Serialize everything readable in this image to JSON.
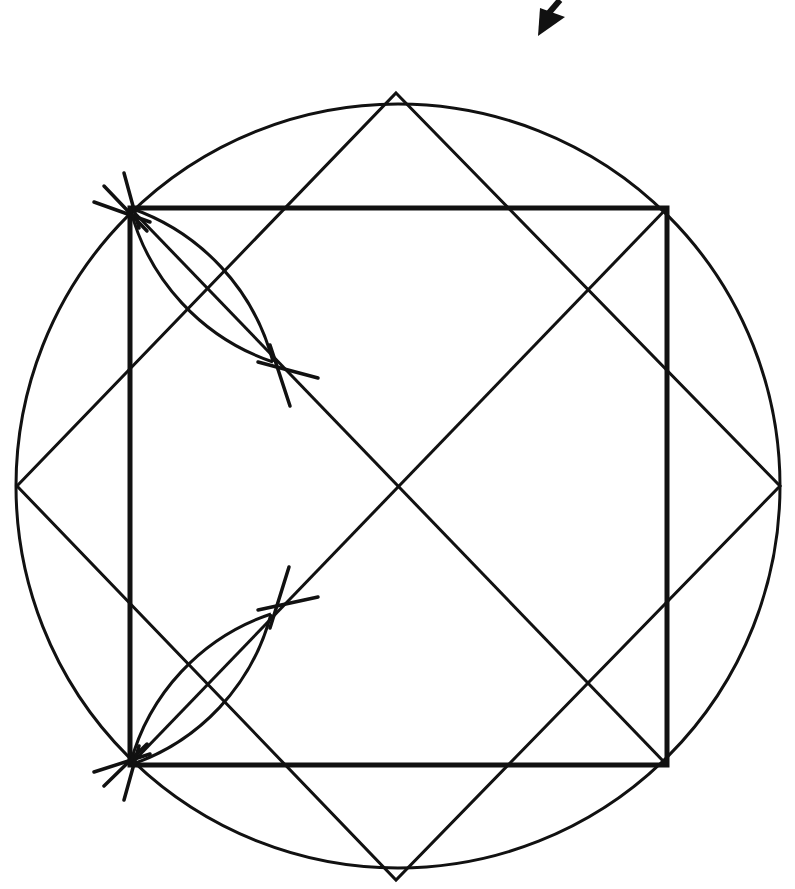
{
  "diagram": {
    "title": "",
    "colors": {
      "stroke": "#111111",
      "background": "#ffffff"
    },
    "circle": {
      "cx": 398,
      "cy": 486,
      "r": 382,
      "stroke_width": 3
    },
    "square": {
      "points": [
        [
          130,
          208
        ],
        [
          667,
          208
        ],
        [
          667,
          765
        ],
        [
          130,
          765
        ]
      ],
      "stroke_width": 5
    },
    "diamond": {
      "points": [
        [
          396,
          93
        ],
        [
          780,
          486
        ],
        [
          396,
          880
        ],
        [
          17,
          486
        ]
      ],
      "stroke_width": 3
    },
    "diagonals": [
      {
        "from": [
          130,
          208
        ],
        "to": [
          667,
          765
        ]
      },
      {
        "from": [
          130,
          765
        ],
        "to": [
          667,
          208
        ]
      }
    ],
    "constructions": [
      {
        "name": "upper-left-bisector",
        "vertex": [
          130,
          208
        ],
        "far_point": [
          273,
          362
        ],
        "tick_marks_vertex": [
          [
            [
              94,
              202
            ],
            [
              150,
              222
            ]
          ],
          [
            [
              104,
              186
            ],
            [
              147,
              231
            ]
          ],
          [
            [
              124,
              173
            ],
            [
              139,
              228
            ]
          ]
        ],
        "tick_marks_far": [
          [
            [
              258,
              362
            ],
            [
              318,
              378
            ]
          ],
          [
            [
              270,
              345
            ],
            [
              290,
              406
            ]
          ]
        ]
      },
      {
        "name": "lower-left-bisector",
        "vertex": [
          130,
          765
        ],
        "far_point": [
          271,
          614
        ],
        "tick_marks_vertex": [
          [
            [
              94,
              772
            ],
            [
              150,
              754
            ]
          ],
          [
            [
              104,
              786
            ],
            [
              147,
              744
            ]
          ],
          [
            [
              124,
              800
            ],
            [
              139,
              746
            ]
          ]
        ],
        "tick_marks_far": [
          [
            [
              258,
              610
            ],
            [
              318,
              597
            ]
          ],
          [
            [
              270,
              628
            ],
            [
              289,
              567
            ]
          ]
        ]
      }
    ],
    "arrow": {
      "name": "pointer-arrow",
      "tip": [
        538,
        35
      ],
      "direction": "down-left"
    }
  }
}
